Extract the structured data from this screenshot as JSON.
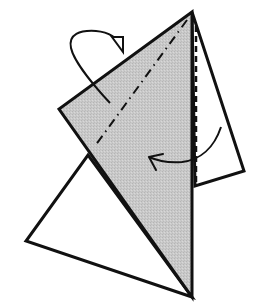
{
  "diagram": {
    "type": "origami-fold-step",
    "colors": {
      "background": "#ffffff",
      "paper_colored_side": "#c6c6c6",
      "paper_white_side": "#ffffff",
      "line": "#111111"
    },
    "shapes": {
      "back_left_triangle": {
        "points": "192,297 26,241 88,155"
      },
      "right_flap": {
        "points": "192,12 244,171 195,186"
      },
      "gray_front_layer": {
        "points": "192,12 59,109 192,297"
      }
    },
    "fold_lines": {
      "mountain_fold": {
        "style": "dash-dot",
        "from": [
          187,
          20
        ],
        "to": [
          95,
          146
        ]
      },
      "valley_fold": {
        "style": "dashed",
        "from": [
          196,
          26
        ],
        "to": [
          196,
          186
        ]
      }
    },
    "arrows": {
      "mountain_fold_arrow": {
        "kind": "fold-behind",
        "description": "looping arrow with hollow head, fold behind"
      },
      "valley_fold_arrow": {
        "kind": "fold-in-front",
        "description": "curved arrow pointing left over the flap"
      }
    }
  }
}
